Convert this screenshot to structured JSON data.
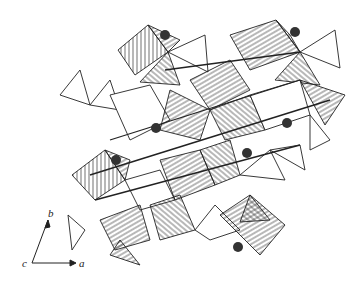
{
  "figure": {
    "type": "crystal-structure-polyhedral-diagram",
    "axes": {
      "a": "a",
      "b": "b",
      "c": "c"
    },
    "caption": "",
    "colors": {
      "line": "#222222",
      "sphere": "#333333",
      "background": "#ffffff"
    },
    "spheres": [
      {
        "x": 165,
        "y": 35
      },
      {
        "x": 295,
        "y": 32
      },
      {
        "x": 156,
        "y": 128
      },
      {
        "x": 116,
        "y": 160
      },
      {
        "x": 247,
        "y": 153
      },
      {
        "x": 287,
        "y": 123
      },
      {
        "x": 238,
        "y": 247
      }
    ]
  }
}
